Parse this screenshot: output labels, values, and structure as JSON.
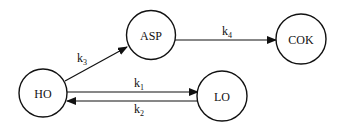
{
  "diagram": {
    "nodes": [
      {
        "id": "HO",
        "label": "HO"
      },
      {
        "id": "ASP",
        "label": "ASP"
      },
      {
        "id": "COK",
        "label": "COK"
      },
      {
        "id": "LO",
        "label": "LO"
      }
    ],
    "edges": [
      {
        "from": "HO",
        "to": "ASP",
        "label": "k",
        "sub": "3"
      },
      {
        "from": "ASP",
        "to": "COK",
        "label": "k",
        "sub": "4"
      },
      {
        "from": "HO",
        "to": "LO",
        "label": "k",
        "sub": "1"
      },
      {
        "from": "LO",
        "to": "HO",
        "label": "k",
        "sub": "2"
      }
    ],
    "colors": {
      "stroke": "#111111",
      "background": "#ffffff"
    }
  }
}
